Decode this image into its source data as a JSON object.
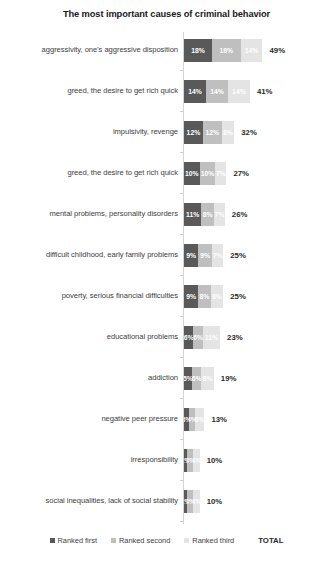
{
  "chart_data": {
    "type": "bar",
    "title": "The most important causes of criminal behavior",
    "xlabel": "",
    "ylabel": "",
    "orientation": "horizontal",
    "stacked": true,
    "grid": false,
    "legend_position": "bottom",
    "xlim": [
      0,
      49
    ],
    "categories": [
      "aggressivity, one's aggressive disposition",
      "greed, the desire to get rich quick",
      "impulsivity, revenge",
      "greed, the desire to get rich quick",
      "mental problems, personality disorders",
      "difficult childhood, early family problems",
      "poverty, serious financial difficulties",
      "educational problems",
      "addiction",
      "negative peer pressure",
      "irresponsibility",
      "social inequalities, lack of social stability"
    ],
    "series": [
      {
        "name": "Ranked first",
        "color": "#595959",
        "values": [
          18,
          14,
          12,
          10,
          11,
          9,
          9,
          6,
          5,
          3,
          2,
          2
        ]
      },
      {
        "name": "Ranked second",
        "color": "#bfbfbf",
        "values": [
          18,
          14,
          12,
          10,
          8,
          9,
          8,
          6,
          6,
          4,
          4,
          4
        ]
      },
      {
        "name": "Ranked third",
        "color": "#e4e4e4",
        "values": [
          14,
          14,
          8,
          7,
          7,
          7,
          8,
          11,
          8,
          6,
          4,
          4
        ]
      }
    ],
    "value_labels": [
      [
        "18%",
        "18%",
        "14%"
      ],
      [
        "14%",
        "14%",
        "14%"
      ],
      [
        "12%",
        "12%",
        "8%"
      ],
      [
        "10%",
        "10%",
        "7%"
      ],
      [
        "11%",
        "8%",
        "7%"
      ],
      [
        "9%",
        "9%",
        "7%"
      ],
      [
        "9%",
        "8%",
        "8%"
      ],
      [
        "6%",
        "6%",
        "11%"
      ],
      [
        "5%",
        "6%",
        "8%"
      ],
      [
        "3%",
        "4%",
        "6%"
      ],
      [
        "2%",
        "4%",
        "4%"
      ],
      [
        "2%",
        "4%",
        "4%"
      ]
    ],
    "totals": [
      49,
      41,
      32,
      27,
      26,
      25,
      25,
      23,
      19,
      13,
      10,
      10
    ],
    "total_labels": [
      "49%",
      "41%",
      "32%",
      "27%",
      "26%",
      "25%",
      "25%",
      "23%",
      "19%",
      "13%",
      "10%",
      "10%"
    ],
    "total_column_header": "TOTAL"
  },
  "legend": {
    "items": [
      {
        "label": "Ranked first",
        "color": "#595959"
      },
      {
        "label": "Ranked second",
        "color": "#bfbfbf"
      },
      {
        "label": "Ranked third",
        "color": "#e4e4e4"
      }
    ],
    "total_label": "TOTAL"
  }
}
